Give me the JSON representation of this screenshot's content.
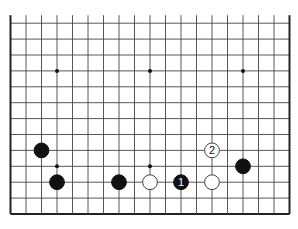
{
  "board": {
    "columns": 19,
    "visible_rows": 13,
    "partial_top": true,
    "left_x": 10.5,
    "col_spacing": 15.5,
    "bottom_y": 214,
    "row_spacing": 15.9,
    "top_stub": 8,
    "line_color": "#444444",
    "edge_color": "#222222",
    "star_points": [
      {
        "col": 3,
        "row": 3
      },
      {
        "col": 9,
        "row": 3
      },
      {
        "col": 15,
        "row": 3
      },
      {
        "col": 3,
        "row": 9
      },
      {
        "col": 9,
        "row": 9
      },
      {
        "col": 15,
        "row": 9
      }
    ]
  },
  "stones": [
    {
      "color": "black",
      "col": 2,
      "row": 8,
      "label": ""
    },
    {
      "color": "black",
      "col": 3,
      "row": 10,
      "label": ""
    },
    {
      "color": "black",
      "col": 7,
      "row": 10,
      "label": ""
    },
    {
      "color": "white",
      "col": 9,
      "row": 10,
      "label": ""
    },
    {
      "color": "black",
      "col": 11,
      "row": 10,
      "label": "1"
    },
    {
      "color": "white",
      "col": 13,
      "row": 10,
      "label": ""
    },
    {
      "color": "white",
      "col": 13,
      "row": 8,
      "label": "2"
    },
    {
      "color": "black",
      "col": 15,
      "row": 9,
      "label": ""
    }
  ]
}
